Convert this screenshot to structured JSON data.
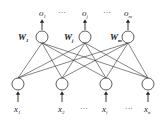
{
  "diagram": {
    "type": "single-layer neural network",
    "outputs": [
      {
        "label": "o",
        "sub": "1",
        "weight": "W",
        "weight_sub": "1",
        "x": 42
      },
      {
        "label": "o",
        "sub": "j",
        "weight": "W",
        "weight_sub": "j",
        "x": 85
      },
      {
        "label": "o",
        "sub": "m",
        "weight": "W",
        "weight_sub": "m",
        "x": 128
      }
    ],
    "inputs": [
      {
        "label": "x",
        "sub": "1",
        "x": 18
      },
      {
        "label": "x",
        "sub": "2",
        "x": 62
      },
      {
        "label": "x",
        "sub": "i",
        "x": 106
      },
      {
        "label": "x",
        "sub": "n",
        "x": 148
      }
    ],
    "ellipsis": "···",
    "connection": "fully connected",
    "line_color": "#333333"
  }
}
